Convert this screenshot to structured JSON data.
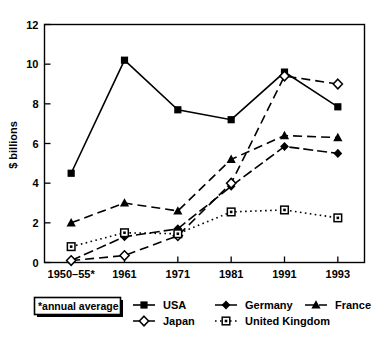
{
  "chart_data": {
    "type": "line",
    "title": "",
    "xlabel": "",
    "ylabel": "$ billions",
    "ylim": [
      0,
      12
    ],
    "yticks": [
      0,
      2,
      4,
      6,
      8,
      10,
      12
    ],
    "grid": false,
    "legend_position": "bottom",
    "categories": [
      "1950–55*",
      "1961",
      "1971",
      "1981",
      "1991",
      "1993"
    ],
    "series": [
      {
        "name": "USA",
        "marker": "filled-square",
        "line": "solid",
        "values": [
          4.5,
          10.2,
          7.7,
          7.2,
          9.6,
          7.85
        ]
      },
      {
        "name": "Germany",
        "marker": "filled-diamond",
        "line": "dash-dot",
        "values": [
          0.1,
          1.3,
          1.7,
          3.85,
          5.85,
          5.5
        ]
      },
      {
        "name": "France",
        "marker": "filled-triangle",
        "line": "dashed",
        "values": [
          2.0,
          3.0,
          2.6,
          5.2,
          6.4,
          6.3
        ]
      },
      {
        "name": "Japan",
        "marker": "open-diamond",
        "line": "dashed",
        "values": [
          0.1,
          0.35,
          1.35,
          4.0,
          9.4,
          9.0
        ]
      },
      {
        "name": "United Kingdom",
        "marker": "open-square-dot",
        "line": "dotted",
        "values": [
          0.8,
          1.5,
          1.45,
          2.55,
          2.65,
          2.25
        ]
      }
    ],
    "annotations": [
      "*annual average"
    ]
  },
  "axis": {
    "y_title": "$ billions",
    "y_ticks": [
      "0",
      "2",
      "4",
      "6",
      "8",
      "10",
      "12"
    ],
    "x_ticks": [
      "1950–55*",
      "1961",
      "1971",
      "1981",
      "1991",
      "1993"
    ]
  },
  "note": {
    "text": "*annual average"
  },
  "legend": {
    "items": [
      {
        "label": "USA"
      },
      {
        "label": "Germany"
      },
      {
        "label": "France"
      },
      {
        "label": "Japan"
      },
      {
        "label": "United Kingdom"
      }
    ]
  },
  "colors": {
    "ink": "#000000",
    "background": "#ffffff"
  }
}
